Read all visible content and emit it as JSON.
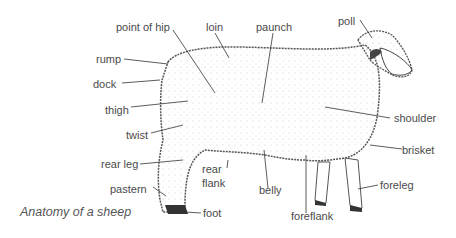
{
  "diagram": {
    "title": "Anatomy of a sheep",
    "subject": "sheep",
    "labels": [
      {
        "id": "point-of-hip",
        "text": "point of hip"
      },
      {
        "id": "loin",
        "text": "loin"
      },
      {
        "id": "paunch",
        "text": "paunch"
      },
      {
        "id": "poll",
        "text": "poll"
      },
      {
        "id": "rump",
        "text": "rump"
      },
      {
        "id": "dock",
        "text": "dock"
      },
      {
        "id": "thigh",
        "text": "thigh"
      },
      {
        "id": "twist",
        "text": "twist"
      },
      {
        "id": "shoulder",
        "text": "shoulder"
      },
      {
        "id": "brisket",
        "text": "brisket"
      },
      {
        "id": "rear-leg",
        "text": "rear leg"
      },
      {
        "id": "rear-flank-1",
        "text": "rear"
      },
      {
        "id": "rear-flank-2",
        "text": "flank"
      },
      {
        "id": "pastern",
        "text": "pastern"
      },
      {
        "id": "belly",
        "text": "belly"
      },
      {
        "id": "foreleg",
        "text": "foreleg"
      },
      {
        "id": "foot",
        "text": "foot"
      },
      {
        "id": "foreflank",
        "text": "foreflank"
      }
    ],
    "colors": {
      "label": "#4a4a4a",
      "leader": "#333333",
      "wool_outline": "#555555"
    }
  }
}
